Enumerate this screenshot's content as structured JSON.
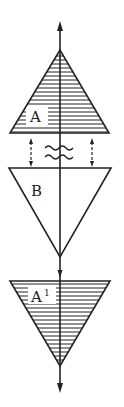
{
  "diagram": {
    "type": "symmetry-diagram",
    "colors": {
      "stroke": "#222222",
      "background": "#ffffff"
    },
    "axis": {
      "x": 60,
      "top_arrow_tip_y": 22,
      "bottom_arrow_tip_y": 392
    },
    "shapes": [
      {
        "id": "A",
        "label": "A",
        "superscript": "",
        "orientation": "up",
        "hatched": true,
        "apex": [
          60,
          50
        ],
        "base_y": 133,
        "base_left": 10,
        "base_right": 109
      },
      {
        "id": "B",
        "label": "B",
        "superscript": "",
        "orientation": "down",
        "hatched": false,
        "apex": [
          60,
          257
        ],
        "base_y": 168,
        "base_left": 9,
        "base_right": 111
      },
      {
        "id": "A1",
        "label": "A",
        "superscript": "1",
        "orientation": "down",
        "hatched": true,
        "apex": [
          60,
          366
        ],
        "base_y": 281,
        "base_left": 10,
        "base_right": 110
      }
    ],
    "connectors": [
      {
        "type": "dashed-double-arrow",
        "x": 31,
        "y1": 139,
        "y2": 166
      },
      {
        "type": "dashed-double-arrow",
        "x": 92,
        "y1": 139,
        "y2": 166
      },
      {
        "type": "wavy-lines",
        "count": 2,
        "center_x": 60,
        "y": [
          146,
          156
        ]
      }
    ]
  }
}
